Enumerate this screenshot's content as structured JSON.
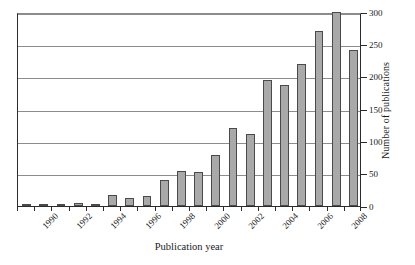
{
  "chart_data": {
    "type": "bar",
    "title": "",
    "xlabel": "Publication year",
    "ylabel": "Number of publications",
    "categories": [
      1990,
      1991,
      1992,
      1993,
      1994,
      1995,
      1996,
      1997,
      1998,
      1999,
      2000,
      2001,
      2002,
      2003,
      2004,
      2005,
      2006,
      2007,
      2008,
      2009
    ],
    "values": [
      1,
      2,
      3,
      4,
      2,
      17,
      13,
      16,
      40,
      54,
      52,
      79,
      120,
      112,
      195,
      187,
      220,
      270,
      300,
      242
    ],
    "series": [
      {
        "name": "Number of publications",
        "values": [
          1,
          2,
          3,
          4,
          2,
          17,
          13,
          16,
          40,
          54,
          52,
          79,
          120,
          112,
          195,
          187,
          220,
          270,
          300,
          242
        ]
      }
    ],
    "xtick_labels": [
      "1990",
      "1992",
      "1994",
      "1996",
      "1998",
      "2000",
      "2002",
      "2004",
      "2006",
      "2008"
    ],
    "xtick_categories": [
      1990,
      1992,
      1994,
      1996,
      1998,
      2000,
      2002,
      2004,
      2006,
      2008
    ],
    "ytick_labels": [
      "0",
      "50",
      "100",
      "150",
      "200",
      "250",
      "300"
    ],
    "ytick_values": [
      0,
      50,
      100,
      150,
      200,
      250,
      300
    ],
    "ylim": [
      0,
      300
    ],
    "grid": "horizontal",
    "legend": "none",
    "bar_color": "#a9a9a9",
    "bar_edge_color": "#4a4a4a",
    "grid_color": "#8d8d8d",
    "axis_color": "#2b2b2b",
    "y_axis_position": "right",
    "xtick_label_rotation": -45
  }
}
